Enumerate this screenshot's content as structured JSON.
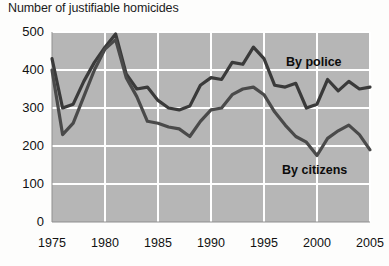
{
  "chart": {
    "title": "Number of justifiable homicides"
  },
  "chart_data": {
    "type": "line",
    "title": "Number of justifiable homicides",
    "xlabel": "",
    "ylabel": "",
    "xlim": [
      1975,
      2005
    ],
    "ylim": [
      0,
      500
    ],
    "yticks": [
      0,
      100,
      200,
      300,
      400,
      500
    ],
    "xticks": [
      1975,
      1980,
      1985,
      1990,
      1995,
      2000,
      2005
    ],
    "grid": true,
    "grid_color": "#ffffff",
    "plot_background": "#b6b6b6",
    "legend_position": "inline-annotation",
    "x": [
      1975,
      1976,
      1977,
      1978,
      1979,
      1980,
      1981,
      1982,
      1983,
      1984,
      1985,
      1986,
      1987,
      1988,
      1989,
      1990,
      1991,
      1992,
      1993,
      1994,
      1995,
      1996,
      1997,
      1998,
      1999,
      2000,
      2001,
      2002,
      2003,
      2004,
      2005
    ],
    "series": [
      {
        "name": "By police",
        "label": "By police",
        "color": "#3a3a3a",
        "values": [
          430,
          300,
          310,
          370,
          420,
          460,
          495,
          390,
          350,
          355,
          320,
          300,
          295,
          305,
          360,
          380,
          375,
          420,
          415,
          460,
          430,
          360,
          355,
          365,
          300,
          310,
          375,
          345,
          370,
          350,
          355
        ]
      },
      {
        "name": "By citizens",
        "label": "By citizens",
        "color": "#4a4a4a",
        "values": [
          400,
          230,
          260,
          330,
          400,
          455,
          480,
          380,
          330,
          265,
          260,
          250,
          245,
          225,
          265,
          295,
          300,
          335,
          350,
          355,
          335,
          290,
          255,
          225,
          210,
          175,
          220,
          240,
          255,
          230,
          190
        ]
      }
    ],
    "annotations": [
      {
        "text": "By police",
        "x": 2000,
        "y": 420
      },
      {
        "text": "By citizens",
        "x": 2000,
        "y": 110
      }
    ]
  },
  "axis": {
    "y_labels": [
      "500",
      "400",
      "300",
      "200",
      "100",
      "0"
    ],
    "x_labels": [
      "1975",
      "1980",
      "1985",
      "1990",
      "1995",
      "2000",
      "2005"
    ]
  }
}
